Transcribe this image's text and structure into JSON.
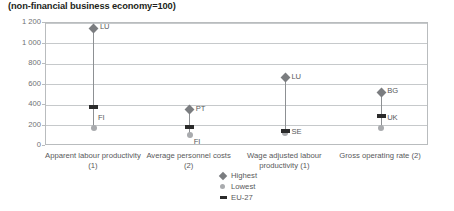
{
  "chart_data": {
    "type": "scatter",
    "title": "(non-financial business economy=100)",
    "xlabel": "",
    "ylabel": "",
    "ylim": [
      0,
      1200
    ],
    "yticks": [
      0,
      200,
      400,
      600,
      800,
      1000,
      1200
    ],
    "ytick_labels": [
      "0",
      "200",
      "400",
      "600",
      "800",
      "1 000",
      "1 200"
    ],
    "grid": true,
    "legend_position": "bottom-center",
    "legend": [
      "Highest",
      "Lowest",
      "EU-27"
    ],
    "categories": [
      "Apparent labour productivity (1)",
      "Average personnel costs (2)",
      "Wage adjusted labour productivity (1)",
      "Gross operating rate (2)"
    ],
    "series": [
      {
        "name": "Highest",
        "marker": "diamond",
        "color": "#7b7d80",
        "values": [
          1150,
          355,
          665,
          525
        ],
        "point_labels": [
          "LU",
          "PT",
          "LU",
          "BG"
        ]
      },
      {
        "name": "Lowest",
        "marker": "circle",
        "color": "#a9abae",
        "values": [
          180,
          105,
          125,
          180
        ],
        "point_labels": [
          "FI",
          "FI",
          "SE",
          "UK"
        ]
      },
      {
        "name": "EU-27",
        "marker": "dash",
        "color": "#2b2b2b",
        "values": [
          385,
          190,
          150,
          290
        ],
        "point_labels": [
          "",
          "",
          "",
          ""
        ]
      }
    ]
  },
  "colors": {
    "highest": "#7b7d80",
    "lowest": "#a9abae",
    "eu27": "#2b2b2b",
    "gridline": "#c6c9cb",
    "frame": "#b9bcbe",
    "text": "#58595b",
    "title": "#231f20"
  }
}
